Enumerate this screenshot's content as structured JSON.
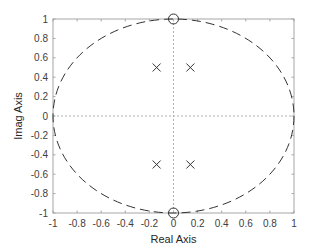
{
  "chart_data": {
    "type": "scatter",
    "title": "",
    "xlabel": "Real Axis",
    "ylabel": "Imag Axis",
    "xlim": [
      -1,
      1
    ],
    "ylim": [
      -1,
      1
    ],
    "xticks": [
      -1,
      -0.8,
      -0.6,
      -0.4,
      -0.2,
      0,
      0.2,
      0.4,
      0.6,
      0.8,
      1
    ],
    "yticks": [
      -1,
      -0.8,
      -0.6,
      -0.4,
      -0.2,
      0,
      0.2,
      0.4,
      0.6,
      0.8,
      1
    ],
    "xtick_labels": [
      "-1",
      "-0.8",
      "-0.6",
      "-0.4",
      "-0.2",
      "0",
      "0.2",
      "0.4",
      "0.6",
      "0.8",
      "1"
    ],
    "ytick_labels": [
      "-1",
      "-0.8",
      "-0.6",
      "-0.4",
      "-0.2",
      "0",
      "0.2",
      "0.4",
      "0.6",
      "0.8",
      "1"
    ],
    "grid": false,
    "unit_circle": true,
    "series": [
      {
        "name": "poles",
        "marker": "x",
        "points": [
          {
            "re": -0.14,
            "im": 0.5
          },
          {
            "re": 0.14,
            "im": 0.5
          },
          {
            "re": -0.14,
            "im": -0.5
          },
          {
            "re": 0.14,
            "im": -0.5
          }
        ]
      },
      {
        "name": "zeros",
        "marker": "o",
        "points": [
          {
            "re": 0,
            "im": 1
          },
          {
            "re": 0,
            "im": -1
          }
        ]
      }
    ]
  },
  "colors": {
    "axes": "#a6a6a6",
    "tick_text": "#404040",
    "circle": "#333333",
    "markers": "#333333",
    "zero_lines": "#b0b0b0"
  }
}
